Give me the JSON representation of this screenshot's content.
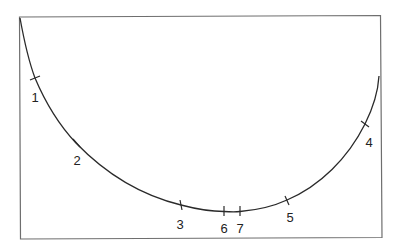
{
  "diagram": {
    "type": "curve-with-numbered-marks",
    "colors": {
      "frame": "#6e6e6e",
      "curve": "#2a2a2a",
      "text": "#222222",
      "background": "#ffffff"
    },
    "marks": [
      {
        "id": "1",
        "label": "1"
      },
      {
        "id": "2",
        "label": "2"
      },
      {
        "id": "3",
        "label": "3"
      },
      {
        "id": "4",
        "label": "4"
      },
      {
        "id": "5",
        "label": "5"
      },
      {
        "id": "6",
        "label": "6"
      },
      {
        "id": "7",
        "label": "7"
      }
    ]
  }
}
